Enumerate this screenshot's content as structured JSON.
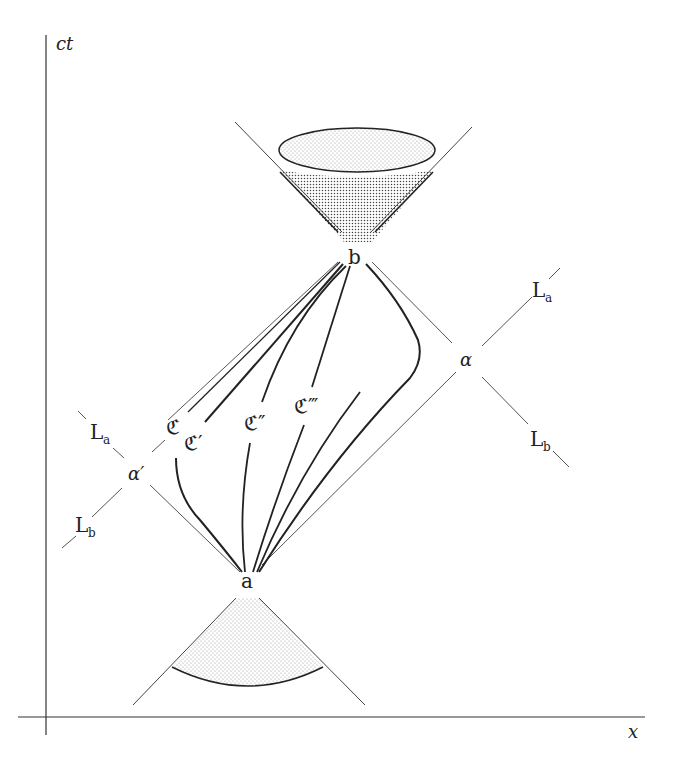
{
  "figure": {
    "axes": {
      "vertical_label": "ct",
      "horizontal_label": "x"
    },
    "events": {
      "a": "a",
      "b": "b"
    },
    "intersections": {
      "alpha": "α",
      "alpha_prime": "α′"
    },
    "light_lines": {
      "La_main": "L",
      "La_sub": "a",
      "Lb_main": "L",
      "Lb_sub": "b"
    },
    "curves": {
      "C": "ℭ",
      "C_prime": "ℭ′",
      "C_double_prime": "ℭ″",
      "C_triple_prime": "ℭ‴"
    },
    "colors": {
      "ink": "#222222",
      "thin_line": "#555555",
      "stipple": "#888888",
      "background": "#ffffff"
    }
  }
}
